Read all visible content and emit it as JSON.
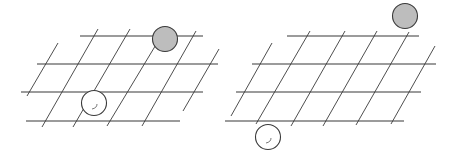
{
  "diagram": {
    "title": "",
    "panels": [
      {
        "id": "left",
        "horizontal_lines": [
          {
            "x1": 80,
            "y1": 36,
            "x2": 203,
            "y2": 36
          },
          {
            "x1": 37,
            "y1": 64,
            "x2": 218,
            "y2": 64
          },
          {
            "x1": 21,
            "y1": 92,
            "x2": 203,
            "y2": 92
          },
          {
            "x1": 26,
            "y1": 121,
            "x2": 180,
            "y2": 121
          }
        ],
        "diagonal_lines": [
          {
            "x1": 58,
            "y1": 43,
            "x2": 27,
            "y2": 96
          },
          {
            "x1": 98,
            "y1": 29,
            "x2": 42,
            "y2": 127
          },
          {
            "x1": 130,
            "y1": 29,
            "x2": 73,
            "y2": 127
          },
          {
            "x1": 157,
            "y1": 43,
            "x2": 107,
            "y2": 126
          },
          {
            "x1": 196,
            "y1": 31,
            "x2": 142,
            "y2": 126
          },
          {
            "x1": 219,
            "y1": 49,
            "x2": 183,
            "y2": 111
          }
        ],
        "stones": [
          {
            "color": "gray",
            "cx": 165,
            "cy": 39,
            "r": 12.5
          },
          {
            "color": "white",
            "cx": 94,
            "cy": 103,
            "r": 12.5
          }
        ]
      },
      {
        "id": "right",
        "horizontal_lines": [
          {
            "x1": 287,
            "y1": 36,
            "x2": 419,
            "y2": 36
          },
          {
            "x1": 252,
            "y1": 64,
            "x2": 436,
            "y2": 64
          },
          {
            "x1": 236,
            "y1": 92,
            "x2": 421,
            "y2": 92
          },
          {
            "x1": 225,
            "y1": 121,
            "x2": 404,
            "y2": 121
          }
        ],
        "diagonal_lines": [
          {
            "x1": 272,
            "y1": 43,
            "x2": 231,
            "y2": 116
          },
          {
            "x1": 310,
            "y1": 31,
            "x2": 256,
            "y2": 124
          },
          {
            "x1": 345,
            "y1": 31,
            "x2": 291,
            "y2": 126
          },
          {
            "x1": 377,
            "y1": 31,
            "x2": 323,
            "y2": 126
          },
          {
            "x1": 409,
            "y1": 32,
            "x2": 356,
            "y2": 125
          },
          {
            "x1": 435,
            "y1": 46,
            "x2": 391,
            "y2": 124
          }
        ],
        "stones": [
          {
            "color": "gray",
            "cx": 405,
            "cy": 16,
            "r": 12.5
          },
          {
            "color": "white",
            "cx": 268,
            "cy": 137,
            "r": 12.5
          }
        ]
      }
    ],
    "colors": {
      "background": "#ffffff",
      "grid_horizontal": "#7a7a7a",
      "grid_diagonal": "#3a3a3a",
      "stone_gray_fill": "#bdbdbd",
      "stone_white_fill": "#ffffff",
      "stone_outline": "#3a3a3a"
    }
  }
}
